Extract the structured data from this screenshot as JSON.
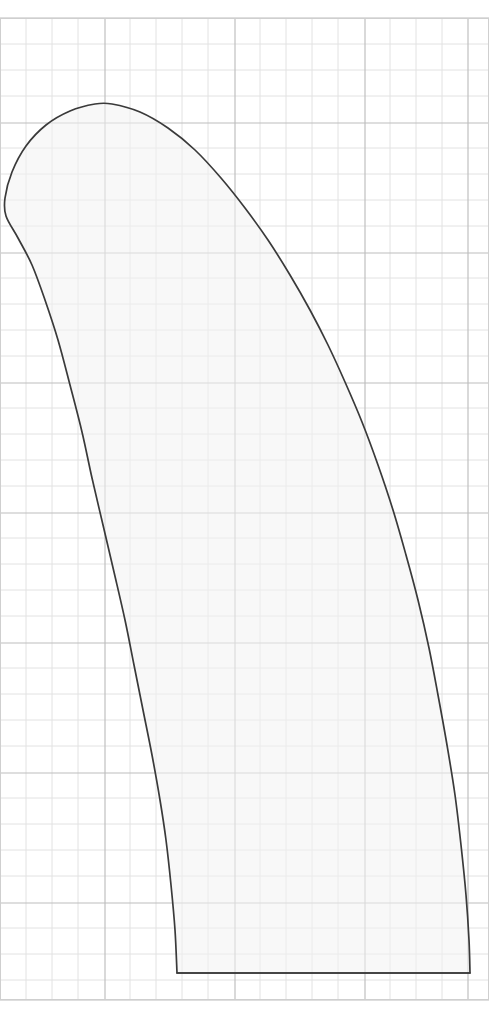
{
  "document": {
    "kind": "technical-drawing",
    "title": "Blade profile outline on graph paper",
    "canvas_width": 489,
    "canvas_height": 1016,
    "background_color": "#ffffff"
  },
  "grid": {
    "minor_spacing_px": 26,
    "major_every_n_minor": 5,
    "major_spacing_px": 130,
    "origin_x": 0,
    "origin_y": 18,
    "x_start": 0,
    "x_end": 489,
    "y_start": 18,
    "y_end": 1000,
    "minor_color": "#e2e2e2",
    "major_color": "#bdbdbd",
    "border_color": "#cfcfcf",
    "major_x_lines": [
      105,
      235,
      365,
      468
    ],
    "major_y_lines": [
      18,
      123,
      253,
      383,
      513,
      643,
      773,
      903,
      1000
    ]
  },
  "shape": {
    "name": "blade-profile-outline",
    "fill_color": "#f3f3f3",
    "fill_opacity": 0.55,
    "stroke_color": "#3a3a3a",
    "stroke_width": 1.7,
    "apex_point": {
      "x": 105,
      "y": 103
    },
    "leftmost_point": {
      "x": 4,
      "y": 215
    },
    "rightmost_point": {
      "x": 470,
      "y": 965
    },
    "base_left_point": {
      "x": 177,
      "y": 973
    },
    "base_right_point": {
      "x": 470,
      "y": 973
    },
    "base_line_y": 973,
    "outline_points": [
      {
        "x": 177,
        "y": 973
      },
      {
        "x": 175,
        "y": 930
      },
      {
        "x": 171,
        "y": 885
      },
      {
        "x": 166,
        "y": 840
      },
      {
        "x": 160,
        "y": 800
      },
      {
        "x": 152,
        "y": 755
      },
      {
        "x": 143,
        "y": 710
      },
      {
        "x": 134,
        "y": 665
      },
      {
        "x": 125,
        "y": 620
      },
      {
        "x": 114,
        "y": 572
      },
      {
        "x": 103,
        "y": 525
      },
      {
        "x": 92,
        "y": 478
      },
      {
        "x": 82,
        "y": 432
      },
      {
        "x": 70,
        "y": 385
      },
      {
        "x": 58,
        "y": 340
      },
      {
        "x": 45,
        "y": 300
      },
      {
        "x": 32,
        "y": 265
      },
      {
        "x": 18,
        "y": 238
      },
      {
        "x": 6,
        "y": 216
      },
      {
        "x": 5,
        "y": 198
      },
      {
        "x": 12,
        "y": 172
      },
      {
        "x": 26,
        "y": 146
      },
      {
        "x": 46,
        "y": 125
      },
      {
        "x": 70,
        "y": 111
      },
      {
        "x": 95,
        "y": 104
      },
      {
        "x": 112,
        "y": 104
      },
      {
        "x": 140,
        "y": 112
      },
      {
        "x": 168,
        "y": 128
      },
      {
        "x": 195,
        "y": 150
      },
      {
        "x": 221,
        "y": 178
      },
      {
        "x": 245,
        "y": 208
      },
      {
        "x": 268,
        "y": 240
      },
      {
        "x": 290,
        "y": 275
      },
      {
        "x": 310,
        "y": 310
      },
      {
        "x": 328,
        "y": 345
      },
      {
        "x": 345,
        "y": 382
      },
      {
        "x": 362,
        "y": 422
      },
      {
        "x": 378,
        "y": 465
      },
      {
        "x": 393,
        "y": 510
      },
      {
        "x": 406,
        "y": 555
      },
      {
        "x": 418,
        "y": 600
      },
      {
        "x": 429,
        "y": 648
      },
      {
        "x": 438,
        "y": 695
      },
      {
        "x": 447,
        "y": 745
      },
      {
        "x": 455,
        "y": 795
      },
      {
        "x": 461,
        "y": 845
      },
      {
        "x": 466,
        "y": 895
      },
      {
        "x": 469,
        "y": 940
      },
      {
        "x": 470,
        "y": 973
      }
    ]
  }
}
